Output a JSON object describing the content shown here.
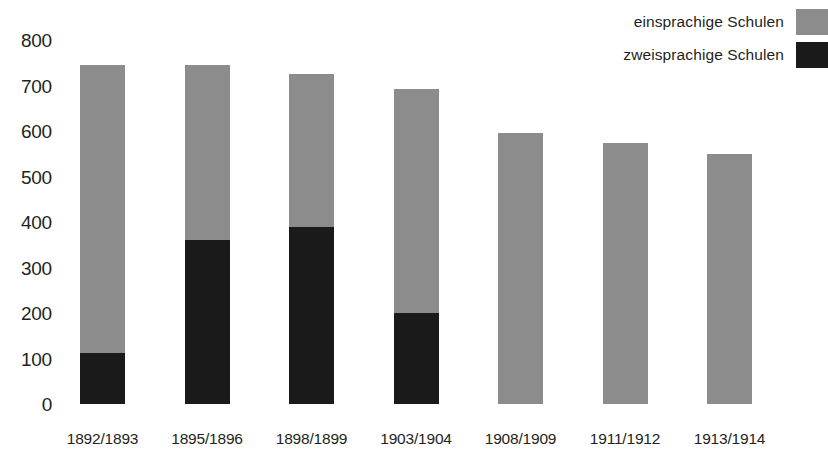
{
  "chart_data": {
    "type": "bar",
    "subtype": "stacked-bar",
    "title": "",
    "subtitle": "",
    "xlabel": "",
    "ylabel": "",
    "categories": [
      "1892/1893",
      "1895/1896",
      "1898/1899",
      "1903/1904",
      "1908/1909",
      "1911/1912",
      "1913/1914"
    ],
    "series": [
      {
        "name": "zweisprachige Schulen",
        "color": "#1a1a1a",
        "values": [
          113,
          360,
          388,
          200,
          0,
          0,
          0
        ]
      },
      {
        "name": "einsprachige Schulen",
        "color": "#8c8c8c",
        "values": [
          632,
          385,
          337,
          493,
          595,
          573,
          550
        ]
      }
    ],
    "totals": [
      745,
      745,
      725,
      693,
      595,
      573,
      550
    ],
    "ylim": [
      0,
      800
    ],
    "yticks": [
      0,
      100,
      200,
      300,
      400,
      500,
      600,
      700,
      800
    ],
    "ytick_labels": [
      "0",
      "100",
      "200",
      "300",
      "400",
      "500",
      "600",
      "700",
      "800"
    ],
    "grid": false,
    "legend_position": "top-right",
    "stack_order": [
      "zweisprachige Schulen",
      "einsprachige Schulen"
    ]
  },
  "legend": {
    "items": [
      {
        "label": "einsprachige Schulen",
        "color": "#8c8c8c"
      },
      {
        "label": "zweisprachige Schulen",
        "color": "#1a1a1a"
      }
    ]
  },
  "colors": {
    "monolingual": "#8c8c8c",
    "bilingual": "#1a1a1a",
    "text": "#231f20",
    "background": "#ffffff"
  }
}
